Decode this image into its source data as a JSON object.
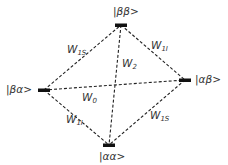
{
  "diagram": {
    "type": "energy-level-transition-diagram",
    "colors": {
      "line": "#222222",
      "bar": "#111111",
      "text": "#333333",
      "background": "#ffffff"
    },
    "nodes": [
      {
        "id": "bb",
        "label": "|ββ>",
        "x": 121,
        "y": 25,
        "text_x": 113,
        "text_y": 6
      },
      {
        "id": "ba",
        "label": "|βα>",
        "x": 44,
        "y": 90,
        "text_x": 6,
        "text_y": 84
      },
      {
        "id": "ab",
        "label": "|αβ>",
        "x": 185,
        "y": 80,
        "text_x": 195,
        "text_y": 74
      },
      {
        "id": "aa",
        "label": "|αα>",
        "x": 109,
        "y": 145,
        "text_x": 99,
        "text_y": 151
      }
    ],
    "edges": [
      {
        "from": "ba",
        "to": "bb",
        "label": "W",
        "sub": "1S",
        "text_x": 67,
        "text_y": 44
      },
      {
        "from": "bb",
        "to": "ab",
        "label": "W",
        "sub": "1I",
        "text_x": 151,
        "text_y": 40
      },
      {
        "from": "bb",
        "to": "aa",
        "label": "W",
        "sub": "2",
        "text_x": 122,
        "text_y": 58
      },
      {
        "from": "ba",
        "to": "ab",
        "label": "W",
        "sub": "0",
        "text_x": 82,
        "text_y": 92
      },
      {
        "from": "ba",
        "to": "aa",
        "label": "W",
        "sub": "1I",
        "text_x": 66,
        "text_y": 114
      },
      {
        "from": "ab",
        "to": "aa",
        "label": "W",
        "sub": "1S",
        "text_x": 150,
        "text_y": 110
      }
    ]
  }
}
